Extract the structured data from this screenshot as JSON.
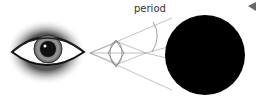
{
  "diagram": {
    "labels": {
      "period": "period"
    },
    "elements": {
      "eye": "eye-illustration",
      "lens": "converging-lens",
      "dot": "black-circle-period",
      "pointer": "left-pointing-triangle"
    },
    "colors": {
      "background": "#ffffff",
      "dot": "#000000",
      "lines": "#999999",
      "iris": "#8a8a8a",
      "pointer": "#666666"
    }
  }
}
